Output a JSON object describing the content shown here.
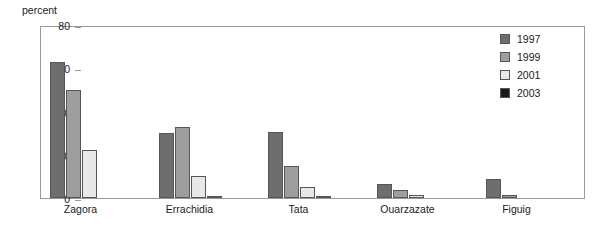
{
  "chart_data": {
    "type": "bar",
    "title": "",
    "subtitle": "",
    "xlabel": "",
    "ylabel": "percent",
    "ylim": [
      0,
      80
    ],
    "yticks": [
      0,
      20,
      40,
      60,
      80
    ],
    "grid": false,
    "legend_position": "top-right",
    "categories": [
      "Zagora",
      "Errachidia",
      "Tata",
      "Ouarzazate",
      "Figuig"
    ],
    "series": [
      {
        "name": "1997",
        "color": "#6e6e6e",
        "values": [
          63,
          30,
          30.5,
          6.5,
          9
        ]
      },
      {
        "name": "1999",
        "color": "#9e9e9e",
        "values": [
          50,
          33,
          15,
          3.5,
          1.5
        ]
      },
      {
        "name": "2001",
        "color": "#e8e8e8",
        "values": [
          22,
          10,
          5,
          1.5,
          0
        ]
      },
      {
        "name": "2003",
        "color": "#1a1a1a",
        "values": [
          0,
          1,
          1,
          0,
          0
        ]
      }
    ]
  },
  "axis": {
    "unit_label": "percent",
    "tick_labels": [
      "0",
      "20",
      "40",
      "60",
      "80"
    ]
  },
  "legend": {
    "items": [
      {
        "label": "1997"
      },
      {
        "label": "1999"
      },
      {
        "label": "2001"
      },
      {
        "label": "2003"
      }
    ]
  },
  "colors": {
    "series_1997": "#6e6e6e",
    "series_1999": "#9e9e9e",
    "series_2001": "#e8e8e8",
    "series_2003": "#1a1a1a",
    "frame": "#9a9a9a",
    "bar_outline": "#55555a",
    "text": "#1a1a1a",
    "background": "#ffffff"
  }
}
